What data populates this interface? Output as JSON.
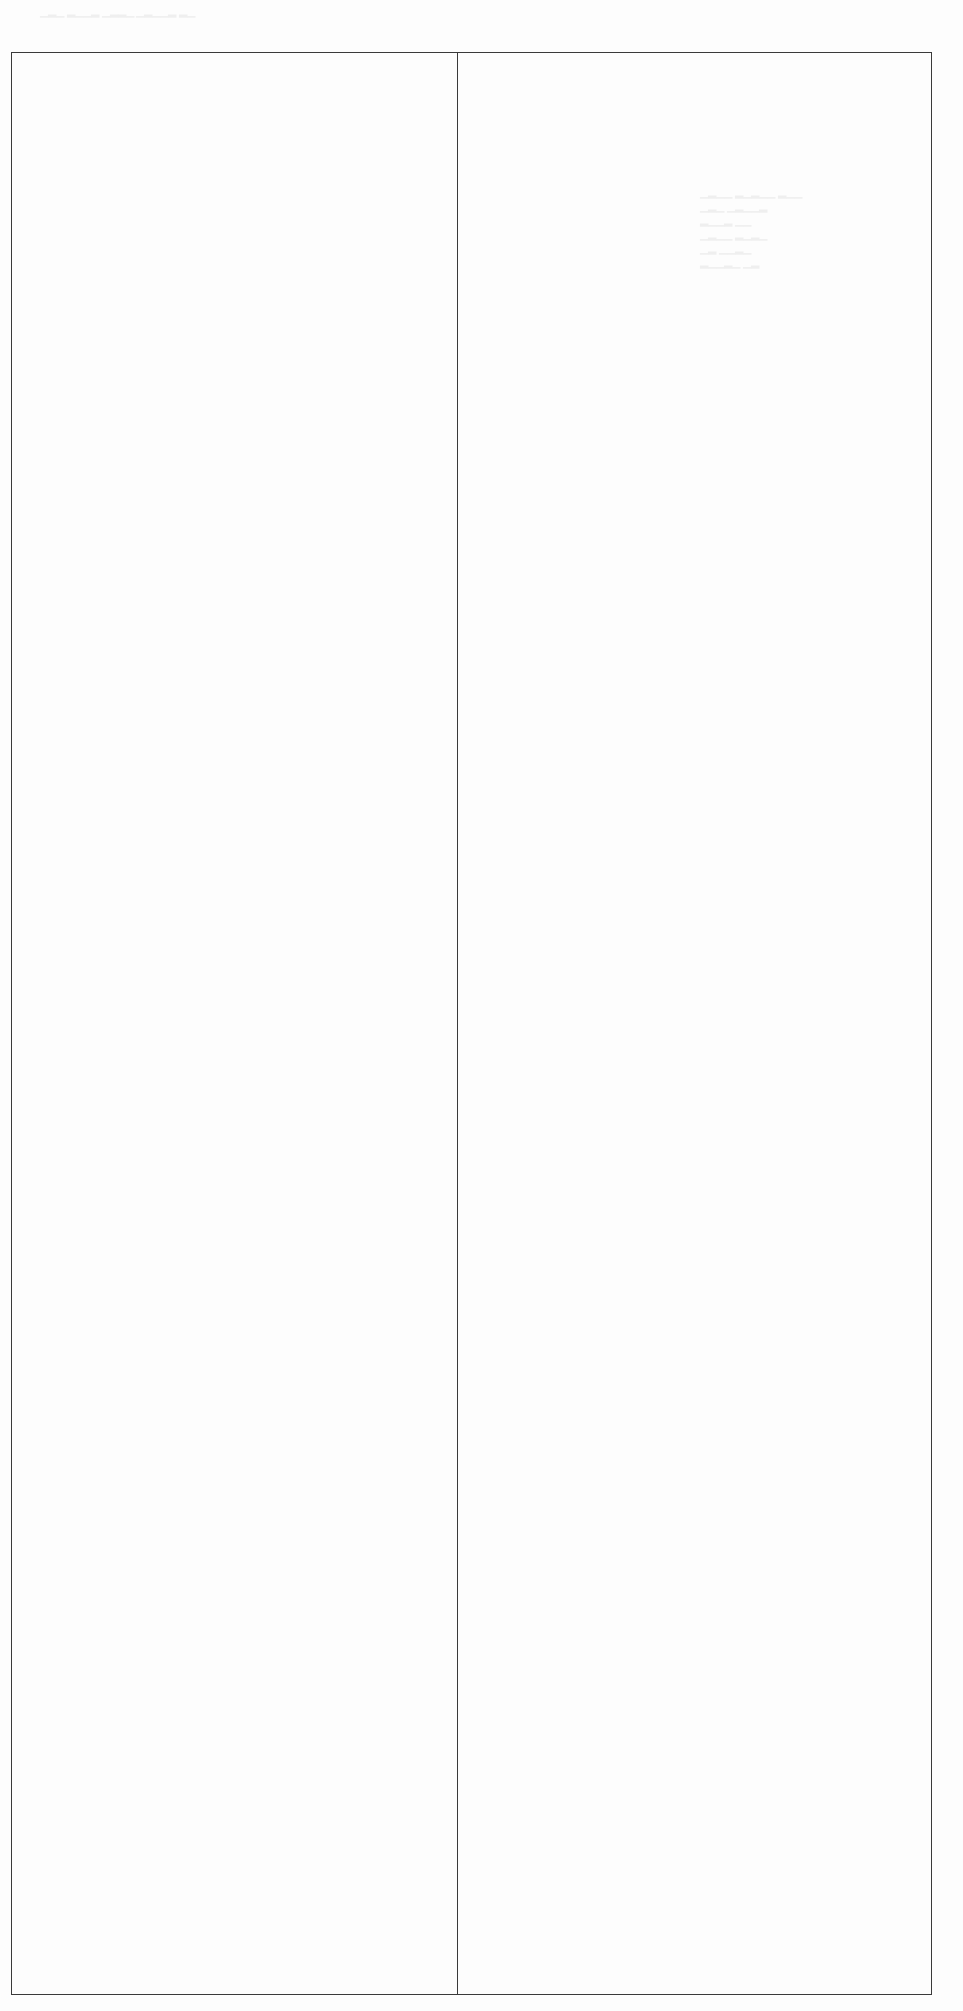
{
  "document": {
    "type": "scanned-form-page",
    "table": {
      "columns": 2,
      "rows": 1,
      "cells": [
        {
          "column": "left",
          "text": ""
        },
        {
          "column": "right",
          "text": ""
        }
      ]
    },
    "colors": {
      "border": "#3a3a3a",
      "background": "#fdfdfd"
    }
  }
}
